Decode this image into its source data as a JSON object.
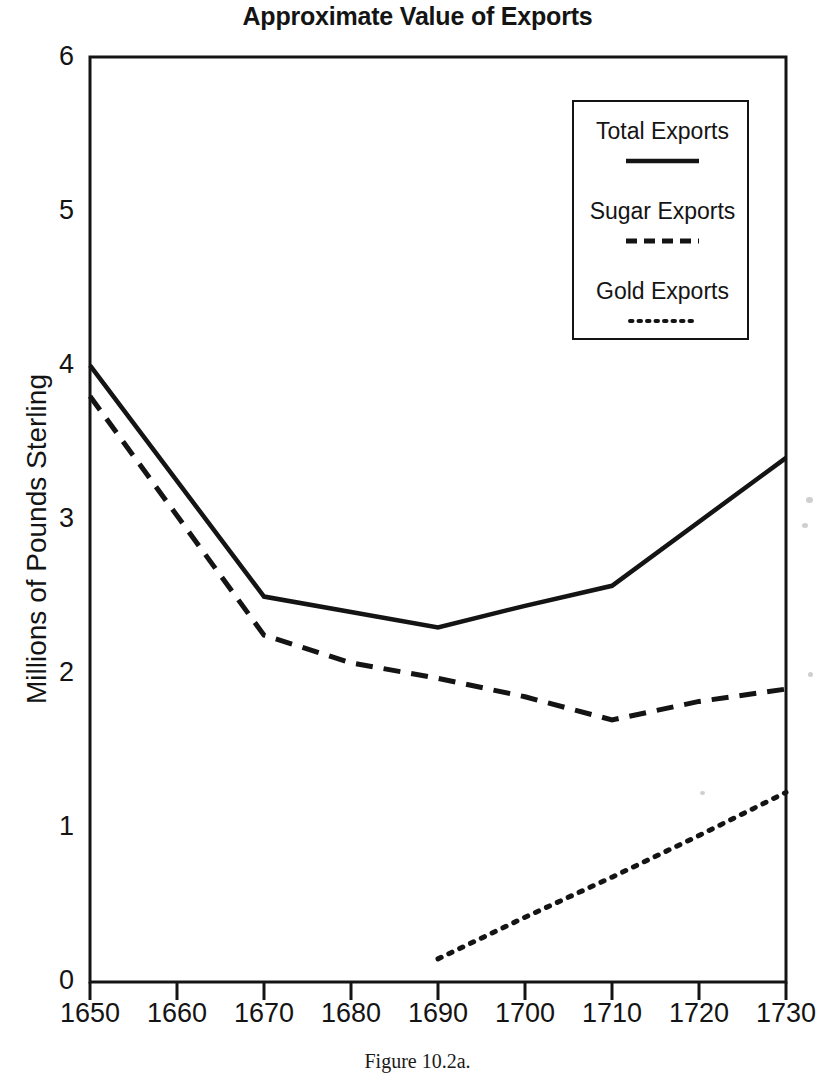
{
  "chart_data": {
    "type": "line",
    "title": "Approximate Value of Exports",
    "xlabel": "",
    "ylabel": "Millions of Pounds Sterling",
    "caption": "Figure 10.2a.",
    "xlim": [
      1650,
      1730
    ],
    "ylim": [
      0,
      6
    ],
    "xticks": [
      1650,
      1660,
      1670,
      1680,
      1690,
      1700,
      1710,
      1720,
      1730
    ],
    "yticks": [
      0,
      1,
      2,
      3,
      4,
      5,
      6
    ],
    "grid": false,
    "legend_position": "top-right",
    "series": [
      {
        "name": "Total Exports",
        "style": "solid",
        "color": "#141414",
        "x": [
          1650,
          1670,
          1680,
          1690,
          1700,
          1710,
          1730
        ],
        "values": [
          4.0,
          2.5,
          2.4,
          2.3,
          2.44,
          2.57,
          3.4
        ]
      },
      {
        "name": "Sugar Exports",
        "style": "dashed",
        "color": "#141414",
        "x": [
          1650,
          1670,
          1680,
          1690,
          1700,
          1710,
          1720,
          1730
        ],
        "values": [
          3.8,
          2.25,
          2.07,
          1.97,
          1.85,
          1.7,
          1.82,
          1.9
        ]
      },
      {
        "name": "Gold Exports",
        "style": "dotted",
        "color": "#141414",
        "x": [
          1690,
          1700,
          1710,
          1720,
          1730
        ],
        "values": [
          0.15,
          0.42,
          0.68,
          0.95,
          1.23
        ]
      }
    ]
  },
  "title": {
    "text": "Approximate Value of Exports"
  },
  "axes": {
    "y_title": "Millions of Pounds Sterling",
    "y_tick_labels": [
      "6",
      "5",
      "4",
      "3",
      "2",
      "1",
      "0"
    ],
    "x_tick_labels": [
      "1650",
      "1660",
      "1670",
      "1680",
      "1690",
      "1700",
      "1710",
      "1720",
      "1730"
    ]
  },
  "legend": {
    "entries": [
      {
        "label": "Total Exports",
        "style": "solid"
      },
      {
        "label": "Sugar Exports",
        "style": "dashed"
      },
      {
        "label": "Gold Exports",
        "style": "dotted"
      }
    ]
  },
  "caption": {
    "text": "Figure 10.2a."
  }
}
